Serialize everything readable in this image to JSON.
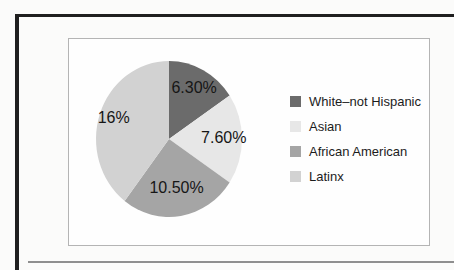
{
  "page": {
    "frame_color": "#1f1f1f",
    "rule_color": "#8f8f8f",
    "panel_background": "#fefefe",
    "panel_border_color": "#b4b4b4"
  },
  "chart_data": {
    "type": "pie",
    "title": "",
    "direction": "clockwise",
    "start_angle_deg": 0,
    "legend_position": "right",
    "categories": [
      "White–not Hispanic",
      "Asian",
      "African American",
      "Latinx"
    ],
    "values": [
      6.3,
      7.6,
      10.5,
      16
    ],
    "slices": [
      {
        "label": "White–not Hispanic",
        "value": 6.3,
        "display": "6.30%",
        "color": "#6b6b6b"
      },
      {
        "label": "Asian",
        "value": 7.6,
        "display": "7.60%",
        "color": "#e7e7e7"
      },
      {
        "label": "African American",
        "value": 10.5,
        "display": "10.50%",
        "color": "#a5a5a5"
      },
      {
        "label": "Latinx",
        "value": 16,
        "display": "16%",
        "color": "#d2d2d2"
      }
    ]
  }
}
